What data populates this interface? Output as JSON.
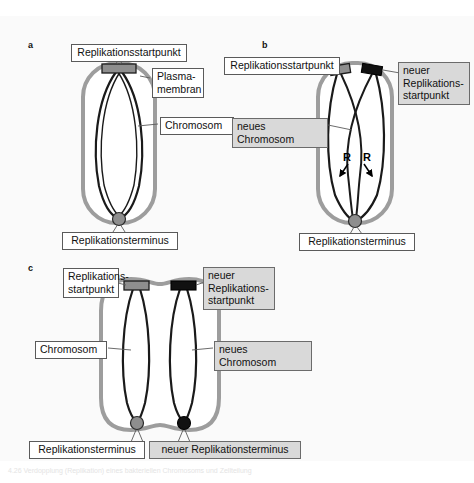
{
  "figure": {
    "background_color": "#fafafa",
    "panels": [
      {
        "letter": "a",
        "title": "Zelle vor der Replikation",
        "labels": {
          "origin": "Replikationsstartpunkt",
          "membrane": "Plasma-\nmembran",
          "chromosome": "Chromosom",
          "terminus": "Replikationsterminus"
        }
      },
      {
        "letter": "b",
        "title": "Zelle waehrend der Replikation",
        "labels": {
          "origin": "Replikationsstartpunkt",
          "new_origin": "neuer\nReplikations-\nstartpunkt",
          "new_chromosome": "neues Chromosom",
          "terminus": "Replikationsterminus",
          "fork_left": "R",
          "fork_right": "R"
        }
      },
      {
        "letter": "c",
        "title": "Zelle nach der Replikation",
        "labels": {
          "origin": "Replikations-\nstartpunkt",
          "new_origin": "neuer\nReplikations-\nstartpunkt",
          "chromosome": "Chromosom",
          "new_chromosome": "neues Chromosom",
          "terminus": "Replikationsterminus",
          "new_terminus": "neuer Replikationsterminus"
        }
      }
    ],
    "colors": {
      "membrane": "#9d9d9d",
      "chromosome": "#1a1a1a",
      "origin_old": "#8e8e8e",
      "origin_new": "#111111",
      "terminus_old": "#8e8e8e",
      "terminus_new": "#111111",
      "label_gray": "#d9d9d9",
      "label_white": "#ffffff"
    },
    "caption": "4.26 Verdopplung (Replikation) eines bakteriellen Chromosoms und Zellteilung"
  }
}
